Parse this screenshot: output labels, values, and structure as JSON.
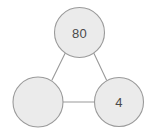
{
  "diagram": {
    "type": "node-link-graph",
    "canvas": {
      "width": 153,
      "height": 131,
      "background": "#ffffff"
    },
    "style": {
      "node_fill": "#ebebeb",
      "node_stroke": "#9a9a9a",
      "edge_stroke": "#9a9a9a",
      "label_color": "#4a4a4a"
    },
    "nodes": [
      {
        "id": "top",
        "label": "80",
        "cx": 79.5,
        "cy": 32.5,
        "r": 25.0
      },
      {
        "id": "bottom-left",
        "label": "",
        "cx": 38.0,
        "cy": 102.0,
        "r": 25.0
      },
      {
        "id": "bottom-right",
        "label": "4",
        "cx": 119.0,
        "cy": 102.0,
        "r": 24.5
      }
    ],
    "edges": [
      {
        "id": "top-to-bottom-left",
        "from": "top",
        "to": "bottom-left",
        "x1": 65.0,
        "y1": 53.5,
        "x2": 52.0,
        "y2": 80.0
      },
      {
        "id": "top-to-bottom-right",
        "from": "top",
        "to": "bottom-right",
        "x1": 94.0,
        "y1": 53.5,
        "x2": 106.5,
        "y2": 80.0
      },
      {
        "id": "bottom-left-to-bottom-right",
        "from": "bottom-left",
        "to": "bottom-right",
        "x1": 63.0,
        "y1": 102.0,
        "x2": 94.5,
        "y2": 102.0
      }
    ]
  }
}
